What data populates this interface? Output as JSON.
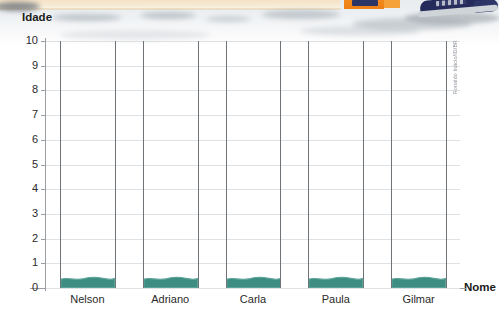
{
  "figure": {
    "axis_titles": {
      "y": "Idade",
      "x": "Nome"
    },
    "credit": "Ronaldo Inácio/ID/BR"
  },
  "chart_data": {
    "type": "bar",
    "title": "",
    "xlabel": "Nome",
    "ylabel": "Idade",
    "categories": [
      "Nelson",
      "Adriano",
      "Carla",
      "Paula",
      "Gilmar"
    ],
    "values": [
      0.35,
      0.35,
      0.35,
      0.35,
      0.35
    ],
    "ylim": [
      0,
      10
    ],
    "yticks": [
      "0",
      "1",
      "2",
      "3",
      "4",
      "5",
      "6",
      "7",
      "8",
      "9",
      "10"
    ],
    "grid": "horizontal",
    "legend": "none",
    "bar_color": "#3d8d82",
    "note": "Bars are drawn with a wavy water-like top edge; all five bars are the same very low height (below 1)."
  },
  "colors": {
    "bar": "#3d8d82",
    "bar_top": "#5ba398",
    "gridline": "#dfe2e4",
    "column_separator": "#6f7478",
    "axis": "#9a9ea2",
    "text": "#2a2a2a",
    "cream_band": "#f5e7cd",
    "orange_tag": "#ee7f14",
    "navy_shoe": "#252c5c"
  }
}
